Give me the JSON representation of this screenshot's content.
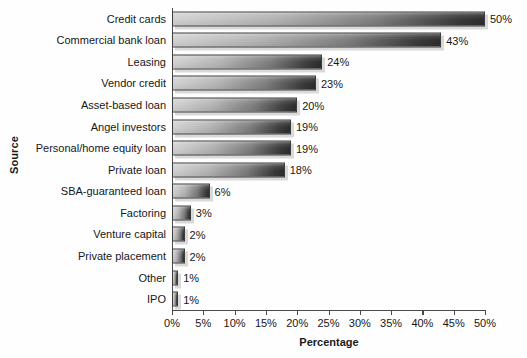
{
  "chart_data": {
    "type": "bar",
    "orientation": "horizontal",
    "title": "",
    "xlabel": "Percentage",
    "ylabel": "Source",
    "xlim": [
      0,
      50
    ],
    "x_tick_labels": [
      "0%",
      "5%",
      "10%",
      "15%",
      "20%",
      "25%",
      "30%",
      "35%",
      "40%",
      "45%",
      "50%"
    ],
    "x_ticks": [
      0,
      5,
      10,
      15,
      20,
      25,
      30,
      35,
      40,
      45,
      50
    ],
    "grid": false,
    "legend": false,
    "categories": [
      "Credit cards",
      "Commercial bank loan",
      "Leasing",
      "Vendor credit",
      "Asset-based loan",
      "Angel investors",
      "Personal/home equity loan",
      "Private loan",
      "SBA-guaranteed loan",
      "Factoring",
      "Venture capital",
      "Private placement",
      "Other",
      "IPO"
    ],
    "values": [
      50,
      43,
      24,
      23,
      20,
      19,
      19,
      18,
      6,
      3,
      2,
      2,
      1,
      1
    ],
    "value_labels": [
      "50%",
      "43%",
      "24%",
      "23%",
      "20%",
      "19%",
      "19%",
      "18%",
      "6%",
      "3%",
      "2%",
      "2%",
      "1%",
      "1%"
    ],
    "bar_gradient_start_color": "#d2d2d2",
    "bar_gradient_end_color": "#2d2d2d",
    "bar_border_color": "#3c3c3c",
    "shadow_color": "#d9d9d9",
    "axis_color": "#4a4a4a",
    "background_color": "#fefefe",
    "text_color": "#171717"
  }
}
